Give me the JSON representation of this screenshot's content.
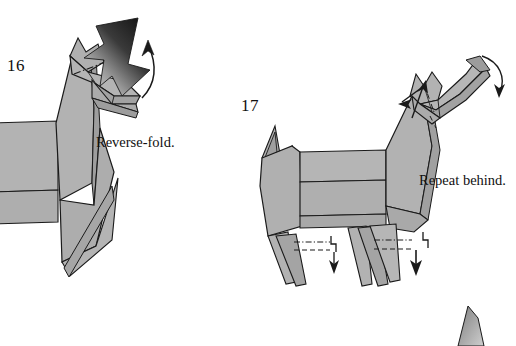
{
  "page": {
    "background_color": "#ffffff",
    "width": 516,
    "height": 346,
    "kind": "origami-instruction-diagram"
  },
  "style": {
    "paper_front_color": "#aaaaaa",
    "paper_front_light_color": "#b8b8b8",
    "paper_shadow_color": "#9a9a9a",
    "paper_highlight_color": "#c2c2c2",
    "outline_color": "#1a1a1a",
    "arrow_dark_color": "#161616",
    "arrow_light_color": "#c9c9c9",
    "text_color": "#101010"
  },
  "steps": [
    {
      "id": "step-16",
      "number": "16",
      "caption": "Reverse-fold.",
      "arrows": [
        {
          "name": "reverse-fold-push-arrow",
          "type": "large-gradient-arrow",
          "direction": "down-left"
        },
        {
          "name": "rotate-up-arrow",
          "type": "thin-curved-arrow",
          "direction": "up"
        }
      ],
      "creases": [
        {
          "name": "head-crease",
          "type": "dash-dot"
        }
      ]
    },
    {
      "id": "step-17",
      "number": "17",
      "caption": "Repeat behind.",
      "arrows": [
        {
          "name": "head-fold-arrow",
          "type": "thin-straight-arrow",
          "direction": "down-left"
        },
        {
          "name": "ear-swing-arrow",
          "type": "thin-curved-arrow",
          "direction": "down-right"
        },
        {
          "name": "front-leg-pleat-arrow",
          "type": "pleat-arrow",
          "direction": "down"
        },
        {
          "name": "hind-leg-pleat-arrow",
          "type": "pleat-arrow",
          "direction": "down"
        }
      ],
      "creases": [
        {
          "name": "front-leg-mountain-crease",
          "type": "dash-dot"
        },
        {
          "name": "front-leg-valley-crease",
          "type": "dashed"
        },
        {
          "name": "hind-leg-mountain-crease",
          "type": "dash-dot"
        },
        {
          "name": "hind-leg-valley-crease",
          "type": "dashed"
        }
      ]
    }
  ],
  "next_step_preview": {
    "name": "next-figure-corner",
    "visible": true
  }
}
